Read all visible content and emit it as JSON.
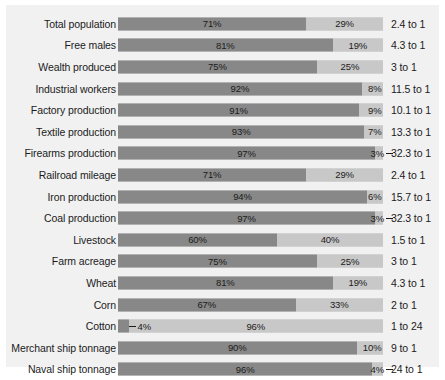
{
  "chart_data": {
    "type": "bar",
    "title": "",
    "subtitle": "",
    "xlabel": "",
    "ylabel": "",
    "xlim": [
      0,
      100
    ],
    "grid": false,
    "legend_position": "none",
    "orientation": "horizontal",
    "stacked": true,
    "normalized_percent": true,
    "colors": {
      "north": "#888888",
      "south": "#c8c8c8",
      "panel_background": "#f1f1f1",
      "page_background": "#ffffff",
      "text": "#1b1b1b"
    },
    "series": [
      {
        "name": "North",
        "values": [
          71,
          81,
          75,
          92,
          91,
          93,
          97,
          71,
          94,
          97,
          60,
          75,
          81,
          67,
          4,
          90,
          96
        ]
      },
      {
        "name": "South",
        "values": [
          29,
          19,
          25,
          8,
          9,
          7,
          3,
          29,
          6,
          3,
          40,
          25,
          19,
          33,
          96,
          10,
          4
        ]
      }
    ],
    "categories": [
      "Total population",
      "Free males",
      "Wealth produced",
      "Industrial workers",
      "Factory production",
      "Textile production",
      "Firearms production",
      "Railroad mileage",
      "Iron production",
      "Coal production",
      "Livestock",
      "Farm acreage",
      "Wheat",
      "Corn",
      "Cotton",
      "Merchant ship tonnage",
      "Naval ship tonnage"
    ],
    "ratios": [
      "2.4 to 1",
      "4.3 to 1",
      "3 to 1",
      "11.5 to 1",
      "10.1 to 1",
      "13.3 to 1",
      "32.3 to 1",
      "2.4 to 1",
      "15.7 to 1",
      "32.3 to 1",
      "1.5 to 1",
      "3 to 1",
      "4.3 to 1",
      "2 to 1",
      "1 to 24",
      "9 to 1",
      "24 to 1"
    ]
  },
  "rows": [
    {
      "label": "Total population",
      "dark": 71,
      "light": 29,
      "dark_label": "71%",
      "light_label": "29%",
      "ratio": "2.4 to 1",
      "dark_style": "inside",
      "light_style": "inside"
    },
    {
      "label": "Free males",
      "dark": 81,
      "light": 19,
      "dark_label": "81%",
      "light_label": "19%",
      "ratio": "4.3 to 1",
      "dark_style": "inside",
      "light_style": "inside"
    },
    {
      "label": "Wealth produced",
      "dark": 75,
      "light": 25,
      "dark_label": "75%",
      "light_label": "25%",
      "ratio": "3 to 1",
      "dark_style": "inside",
      "light_style": "inside"
    },
    {
      "label": "Industrial workers",
      "dark": 92,
      "light": 8,
      "dark_label": "92%",
      "light_label": "8%",
      "ratio": "11.5 to 1",
      "dark_style": "inside",
      "light_style": "outside-right"
    },
    {
      "label": "Factory production",
      "dark": 91,
      "light": 9,
      "dark_label": "91%",
      "light_label": "9%",
      "ratio": "10.1 to 1",
      "dark_style": "inside",
      "light_style": "outside-right"
    },
    {
      "label": "Textile production",
      "dark": 93,
      "light": 7,
      "dark_label": "93%",
      "light_label": "7%",
      "ratio": "13.3 to 1",
      "dark_style": "inside",
      "light_style": "outside-right"
    },
    {
      "label": "Firearms production",
      "dark": 97,
      "light": 3,
      "dark_label": "97%",
      "light_label": "3%",
      "ratio": "32.3 to 1",
      "dark_style": "inside",
      "light_style": "leader-right"
    },
    {
      "label": "Railroad mileage",
      "dark": 71,
      "light": 29,
      "dark_label": "71%",
      "light_label": "29%",
      "ratio": "2.4 to 1",
      "dark_style": "inside",
      "light_style": "inside"
    },
    {
      "label": "Iron production",
      "dark": 94,
      "light": 6,
      "dark_label": "94%",
      "light_label": "6%",
      "ratio": "15.7 to 1",
      "dark_style": "inside",
      "light_style": "outside-right"
    },
    {
      "label": "Coal production",
      "dark": 97,
      "light": 3,
      "dark_label": "97%",
      "light_label": "3%",
      "ratio": "32.3 to 1",
      "dark_style": "inside",
      "light_style": "leader-right"
    },
    {
      "label": "Livestock",
      "dark": 60,
      "light": 40,
      "dark_label": "60%",
      "light_label": "40%",
      "ratio": "1.5 to 1",
      "dark_style": "inside",
      "light_style": "inside"
    },
    {
      "label": "Farm acreage",
      "dark": 75,
      "light": 25,
      "dark_label": "75%",
      "light_label": "25%",
      "ratio": "3 to 1",
      "dark_style": "inside",
      "light_style": "inside"
    },
    {
      "label": "Wheat",
      "dark": 81,
      "light": 19,
      "dark_label": "81%",
      "light_label": "19%",
      "ratio": "4.3 to 1",
      "dark_style": "inside",
      "light_style": "inside"
    },
    {
      "label": "Corn",
      "dark": 67,
      "light": 33,
      "dark_label": "67%",
      "light_label": "33%",
      "ratio": "2 to 1",
      "dark_style": "inside",
      "light_style": "inside"
    },
    {
      "label": "Cotton",
      "dark": 4,
      "light": 96,
      "dark_label": "4%",
      "light_label": "96%",
      "ratio": "1 to 24",
      "dark_style": "leader-left",
      "light_style": "inside"
    },
    {
      "label": "Merchant ship tonnage",
      "dark": 90,
      "light": 10,
      "dark_label": "90%",
      "light_label": "10%",
      "ratio": "9 to 1",
      "dark_style": "inside",
      "light_style": "outside-right"
    },
    {
      "label": "Naval ship tonnage",
      "dark": 96,
      "light": 4,
      "dark_label": "96%",
      "light_label": "4%",
      "ratio": "24 to 1",
      "dark_style": "inside",
      "light_style": "leader-right"
    }
  ]
}
